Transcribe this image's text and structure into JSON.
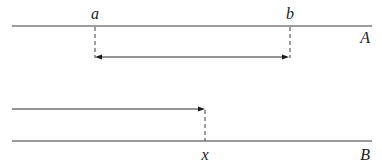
{
  "diagram": {
    "type": "interval-timeline",
    "colors": {
      "line": "#3a3a3a",
      "text": "#1a1a1a",
      "background": "#ffffff"
    },
    "lines": [
      {
        "id": "A",
        "label": "A",
        "y": 26,
        "x_start": 12,
        "x_end": 372,
        "points": [
          {
            "label": "a",
            "x": 95
          },
          {
            "label": "b",
            "x": 290
          }
        ],
        "interval_arrow": {
          "from": "a",
          "to": "b",
          "y": 57,
          "heads": "both"
        }
      },
      {
        "id": "B",
        "label": "B",
        "y": 141,
        "x_start": 12,
        "x_end": 372,
        "points": [
          {
            "label": "x",
            "x": 205
          }
        ],
        "interval_arrow": {
          "from": "left-edge",
          "to": "x",
          "y": 109,
          "heads": "end"
        }
      }
    ],
    "labels": {
      "a": "a",
      "b": "b",
      "A": "A",
      "x": "x",
      "B": "B"
    }
  }
}
